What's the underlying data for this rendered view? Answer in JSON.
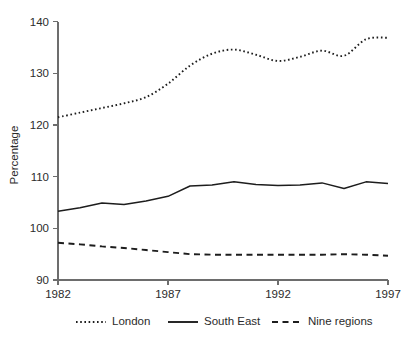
{
  "chart_data": {
    "type": "line",
    "title": "",
    "xlabel": "",
    "ylabel": "Percentage",
    "xlim": [
      1982,
      1997
    ],
    "ylim": [
      90,
      140
    ],
    "grid": false,
    "legend_position": "bottom",
    "x": [
      1982,
      1983,
      1984,
      1985,
      1986,
      1987,
      1988,
      1989,
      1990,
      1991,
      1992,
      1993,
      1994,
      1995,
      1996,
      1997
    ],
    "xticks": [
      1982,
      1987,
      1992,
      1997
    ],
    "xtick_labels": [
      "1982",
      "1987",
      "1992",
      "1997"
    ],
    "yticks": [
      90,
      100,
      110,
      120,
      130,
      140
    ],
    "ytick_labels": [
      "90",
      "100",
      "110",
      "120",
      "130",
      "140"
    ],
    "series": [
      {
        "name": "London",
        "style": "dotted",
        "color": "#1d1d1d",
        "values": [
          121.5,
          122.4,
          123.3,
          124.2,
          125.4,
          128.0,
          131.5,
          133.8,
          134.6,
          133.6,
          132.4,
          133.2,
          134.4,
          133.4,
          136.6,
          136.9
        ]
      },
      {
        "name": "South East",
        "style": "solid",
        "color": "#1d1d1d",
        "values": [
          103.3,
          104.0,
          104.9,
          104.6,
          105.3,
          106.2,
          108.2,
          108.4,
          109.0,
          108.5,
          108.3,
          108.4,
          108.8,
          107.7,
          109.0,
          108.7
        ]
      },
      {
        "name": "Nine regions",
        "style": "dashed",
        "color": "#1d1d1d",
        "values": [
          97.2,
          96.9,
          96.5,
          96.2,
          95.8,
          95.4,
          95.0,
          94.9,
          94.9,
          94.9,
          94.9,
          94.9,
          94.9,
          95.0,
          94.9,
          94.7
        ]
      }
    ]
  },
  "legend": {
    "items": [
      {
        "label": "London"
      },
      {
        "label": "South East"
      },
      {
        "label": "Nine regions"
      }
    ]
  }
}
